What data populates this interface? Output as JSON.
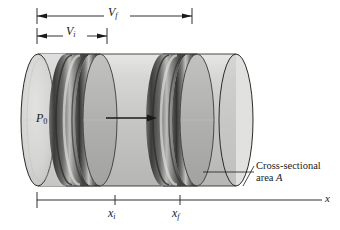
{
  "figure": {
    "background_color": "#ffffff",
    "line_color": "#1a1a1a"
  },
  "dimensions": {
    "final_volume": {
      "symbol": "V",
      "subscript": "f",
      "name": "final-volume"
    },
    "initial_volume": {
      "symbol": "V",
      "subscript": "i",
      "name": "initial-volume"
    }
  },
  "labels": {
    "pressure": {
      "symbol": "P",
      "subscript": "0"
    },
    "position_initial": {
      "symbol": "x",
      "subscript": "i"
    },
    "position_final": {
      "symbol": "x",
      "subscript": "f"
    },
    "axis": "x",
    "cross_section_line1": "Cross-sectional",
    "cross_section_line2_text": "area ",
    "cross_section_line2_symbol": "A"
  },
  "colors": {
    "cylinder_body": "#c8c8c6",
    "cylinder_body_light": "#dcdcda",
    "cylinder_cap_left": "#d2d2d0",
    "piston_face": "#b4b4b2",
    "piston_band_dark": "#4a4a48",
    "piston_band_mid": "#8a8a88",
    "piston_band_light": "#c6c6c4",
    "outline": "#222222",
    "text": "#1a1a1a"
  },
  "annotations": {
    "motion_arrow": "rightward-motion-arrow",
    "leader_line": "cross-section-leader-line"
  }
}
